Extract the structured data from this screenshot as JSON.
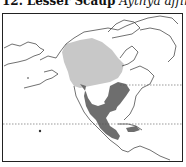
{
  "title": {
    "number": "12.",
    "common_name": "Lesser Scaup",
    "scientific_name": "Aythya affinis"
  },
  "legend": {
    "breeding_range_color": "#c8c8c8",
    "wintering_range_color": "#6e6e6e",
    "coastline_color": "#333333"
  },
  "map": {
    "region": "North and Central America",
    "reference_lines": [
      "tropic-of-cancer",
      "latitude-49"
    ]
  }
}
